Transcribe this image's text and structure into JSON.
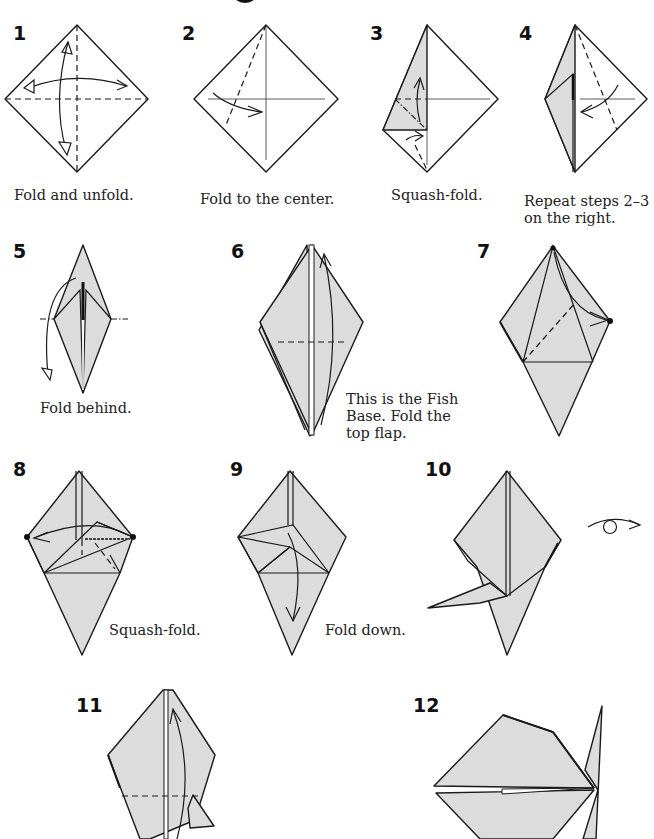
{
  "diagram": {
    "colors": {
      "paper_shade": "#dcdcdc",
      "paper_white": "#ffffff",
      "line": "#1a1a1a"
    },
    "steps": [
      {
        "number": "1",
        "caption": "Fold and unfold."
      },
      {
        "number": "2",
        "caption": "Fold to the center."
      },
      {
        "number": "3",
        "caption": "Squash-fold."
      },
      {
        "number": "4",
        "caption_line1": "Repeat steps 2–3",
        "caption_line2": "on the right."
      },
      {
        "number": "5",
        "caption": "Fold behind."
      },
      {
        "number": "6",
        "caption_line1": "This is the Fish",
        "caption_line2": "Base. Fold the",
        "caption_line3": "top flap."
      },
      {
        "number": "7",
        "caption": ""
      },
      {
        "number": "8",
        "caption": "Squash-fold."
      },
      {
        "number": "9",
        "caption": "Fold down."
      },
      {
        "number": "10",
        "caption": "",
        "symbol": "turn-over-icon"
      },
      {
        "number": "11",
        "caption": ""
      },
      {
        "number": "12",
        "caption": ""
      }
    ]
  }
}
